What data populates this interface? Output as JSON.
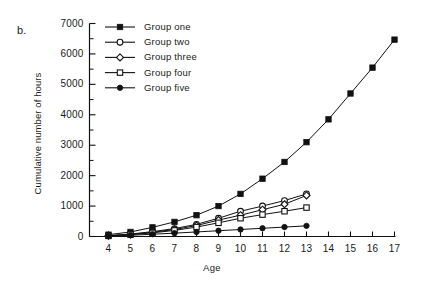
{
  "figure": {
    "panel_label": "b."
  },
  "chart_data": {
    "type": "line",
    "title": "",
    "subtitle": "",
    "xlabel": "Age",
    "ylabel": "Cumulative number of hours",
    "xlim": [
      4,
      17
    ],
    "ylim": [
      0,
      7000
    ],
    "x_ticks": [
      4,
      5,
      6,
      7,
      8,
      9,
      10,
      11,
      12,
      13,
      14,
      15,
      16,
      17
    ],
    "x_tick_labels": [
      "4",
      "5",
      "6",
      "7",
      "8",
      "9",
      "10",
      "11",
      "12",
      "13",
      "14",
      "15",
      "16",
      "17"
    ],
    "y_ticks": [
      0,
      1000,
      2000,
      3000,
      4000,
      5000,
      6000,
      7000
    ],
    "y_tick_labels": [
      "0",
      "1000",
      "2000",
      "3000",
      "4000",
      "5000",
      "6000",
      "7000"
    ],
    "y_minor_ticks": [
      500,
      1500,
      2500,
      3500,
      4500,
      5500,
      6500
    ],
    "grid": false,
    "legend_position": "top-left-inside",
    "line_color": "#111111",
    "series": [
      {
        "name": "Group one",
        "marker": "filled-square",
        "x": [
          4,
          5,
          6,
          7,
          8,
          9,
          10,
          11,
          12,
          13,
          14,
          15,
          16,
          17
        ],
        "values": [
          60,
          150,
          300,
          480,
          700,
          1000,
          1400,
          1900,
          2450,
          3100,
          3850,
          4700,
          5550,
          6470
        ]
      },
      {
        "name": "Group two",
        "marker": "open-circle",
        "x": [
          4,
          5,
          6,
          7,
          8,
          9,
          10,
          11,
          12,
          13
        ],
        "values": [
          30,
          80,
          160,
          260,
          400,
          600,
          830,
          1000,
          1180,
          1400
        ]
      },
      {
        "name": "Group three",
        "marker": "open-diamond",
        "x": [
          4,
          5,
          6,
          7,
          8,
          9,
          10,
          11,
          12,
          13
        ],
        "values": [
          25,
          70,
          140,
          230,
          360,
          540,
          700,
          880,
          1060,
          1350
        ]
      },
      {
        "name": "Group four",
        "marker": "open-square",
        "x": [
          4,
          5,
          6,
          7,
          8,
          9,
          10,
          11,
          12,
          13
        ],
        "values": [
          20,
          60,
          120,
          200,
          310,
          450,
          600,
          720,
          830,
          950
        ]
      },
      {
        "name": "Group five",
        "marker": "filled-circle",
        "x": [
          4,
          5,
          6,
          7,
          8,
          9,
          10,
          11,
          12,
          13
        ],
        "values": [
          15,
          40,
          75,
          110,
          150,
          190,
          230,
          270,
          310,
          350
        ]
      }
    ],
    "legend": [
      {
        "label": "Group one",
        "marker": "filled-square"
      },
      {
        "label": "Group two",
        "marker": "open-circle"
      },
      {
        "label": "Group three",
        "marker": "open-diamond"
      },
      {
        "label": "Group four",
        "marker": "open-square"
      },
      {
        "label": "Group five",
        "marker": "filled-circle"
      }
    ]
  }
}
